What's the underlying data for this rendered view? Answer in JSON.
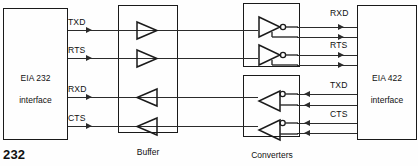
{
  "figure": {
    "number": "232",
    "blocks": {
      "left": {
        "line1": "EIA 232",
        "line2": "interface"
      },
      "right": {
        "line1": "EIA 422",
        "line2": "interface"
      },
      "buffer": {
        "line1": "Buffer",
        "line2": "amplifiers"
      },
      "converters": {
        "line1": "Converters"
      }
    },
    "left_signals": [
      {
        "name": "TXD",
        "direction": "right"
      },
      {
        "name": "RTS",
        "direction": "right"
      },
      {
        "name": "RXD",
        "direction": "right"
      },
      {
        "name": "CTS",
        "direction": "right"
      }
    ],
    "right_signals": [
      {
        "name": "RXD",
        "direction": "right"
      },
      {
        "name": "RTS",
        "direction": "right"
      },
      {
        "name": "TXD",
        "direction": "left"
      },
      {
        "name": "CTS",
        "direction": "left"
      }
    ],
    "buffer_amplifiers": [
      {
        "signal": "TXD",
        "orientation": "right"
      },
      {
        "signal": "RTS",
        "orientation": "right"
      },
      {
        "signal": "RXD",
        "orientation": "left"
      },
      {
        "signal": "CTS",
        "orientation": "left"
      }
    ],
    "converters": [
      {
        "signal": "RXD",
        "orientation": "right",
        "inverting": "true",
        "group": "top"
      },
      {
        "signal": "RTS",
        "orientation": "right",
        "inverting": "true",
        "group": "top"
      },
      {
        "signal": "TXD",
        "orientation": "left",
        "inverting": "true",
        "group": "bottom"
      },
      {
        "signal": "CTS",
        "orientation": "left",
        "inverting": "true",
        "group": "bottom"
      }
    ],
    "colors": {
      "line": "#2b2b2b",
      "text": "#111111",
      "background": "#ffffff"
    }
  }
}
